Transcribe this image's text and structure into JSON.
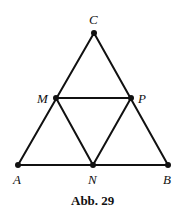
{
  "figure": {
    "caption": "Abb. 29",
    "points": {
      "C": {
        "label": "C",
        "x": 94,
        "y": 33
      },
      "M": {
        "label": "M",
        "x": 56,
        "y": 98
      },
      "P": {
        "label": "P",
        "x": 131,
        "y": 98
      },
      "A": {
        "label": "A",
        "x": 18,
        "y": 165
      },
      "N": {
        "label": "N",
        "x": 93,
        "y": 165
      },
      "B": {
        "label": "B",
        "x": 168,
        "y": 165
      }
    },
    "segments": [
      [
        "A",
        "C"
      ],
      [
        "C",
        "B"
      ],
      [
        "A",
        "B"
      ],
      [
        "M",
        "P"
      ],
      [
        "M",
        "N"
      ],
      [
        "N",
        "P"
      ]
    ],
    "colors": {
      "stroke": "#111111",
      "background": "#ffffff"
    }
  }
}
